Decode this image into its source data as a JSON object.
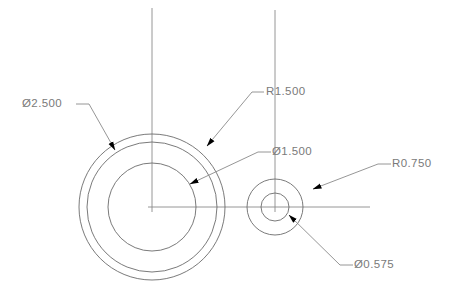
{
  "drawing": {
    "title": "Concentric Circles Dimensioned Drawing",
    "background_color": "#ffffff",
    "geometry_color": "#6b6b6b",
    "centerline_color": "#8a8a8a",
    "leader_color": "#8a8a8a",
    "text_color": "#7a7a7a",
    "arrow_color": "#000000",
    "views": [
      {
        "name": "large-boss",
        "center": {
          "x": 152,
          "y": 207
        },
        "circles": [
          {
            "name": "outer-circle",
            "radius": 73
          },
          {
            "name": "middle-circle",
            "radius": 65
          },
          {
            "name": "inner-circle",
            "radius": 44
          }
        ]
      },
      {
        "name": "small-boss",
        "center": {
          "x": 275,
          "y": 207
        },
        "circles": [
          {
            "name": "outer-circle",
            "radius": 28
          },
          {
            "name": "inner-circle",
            "radius": 14
          }
        ]
      }
    ],
    "centerlines": [
      {
        "name": "horizontal-centerline",
        "x1": 148,
        "y1": 207,
        "x2": 370,
        "y2": 207
      },
      {
        "name": "vertical-centerline-left",
        "x1": 152,
        "y1": 8,
        "x2": 152,
        "y2": 212
      },
      {
        "name": "vertical-centerline-right",
        "x1": 275,
        "y1": 10,
        "x2": 275,
        "y2": 212
      }
    ],
    "dimensions": [
      {
        "id": "dia-2500",
        "label": "Ø2.500",
        "text_x": 22,
        "text_y": 104,
        "shelf": {
          "x1": 76,
          "y1": 104,
          "x2": 89,
          "y2": 104
        },
        "leader": {
          "x1": 89,
          "y1": 104,
          "x2": 115,
          "y2": 150
        },
        "arrow": {
          "x": 115,
          "y": 150,
          "angle": 61
        }
      },
      {
        "id": "rad-1500",
        "label": "R1.500",
        "text_x": 266,
        "text_y": 92,
        "shelf": {
          "x1": 252,
          "y1": 92,
          "x2": 264,
          "y2": 92
        },
        "leader": {
          "x1": 252,
          "y1": 92,
          "x2": 207,
          "y2": 146
        },
        "arrow": {
          "x": 207,
          "y": 146,
          "angle": 230
        }
      },
      {
        "id": "dia-1500",
        "label": "Ø1.500",
        "text_x": 272,
        "text_y": 152,
        "shelf": {
          "x1": 258,
          "y1": 152,
          "x2": 271,
          "y2": 152
        },
        "leader": {
          "x1": 258,
          "y1": 152,
          "x2": 190,
          "y2": 184
        },
        "arrow": {
          "x": 190,
          "y": 184,
          "angle": 205
        }
      },
      {
        "id": "rad-0750",
        "label": "R0.750",
        "text_x": 392,
        "text_y": 164,
        "shelf": {
          "x1": 378,
          "y1": 164,
          "x2": 391,
          "y2": 164
        },
        "leader": {
          "x1": 378,
          "y1": 164,
          "x2": 313,
          "y2": 189
        },
        "arrow": {
          "x": 313,
          "y": 189,
          "angle": 201
        }
      },
      {
        "id": "dia-0575",
        "label": "Ø0.575",
        "text_x": 354,
        "text_y": 265,
        "shelf": {
          "x1": 340,
          "y1": 265,
          "x2": 353,
          "y2": 265
        },
        "leader": {
          "x1": 340,
          "y1": 265,
          "x2": 289,
          "y2": 215
        },
        "arrow": {
          "x": 289,
          "y": 215,
          "angle": 315
        }
      }
    ]
  }
}
